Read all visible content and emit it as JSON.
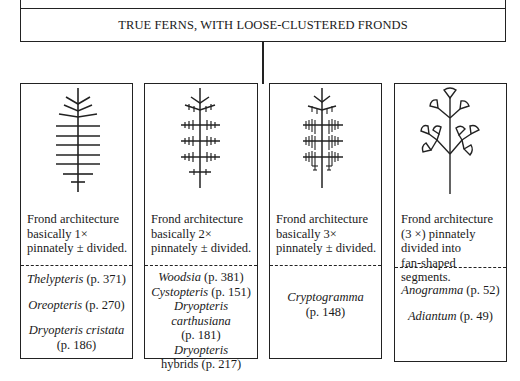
{
  "chart_header": "CHART 9",
  "title": "TRUE FERNS, WITH LOOSE-CLUSTERED FRONDS",
  "columns": [
    {
      "icon": "once-pinnate-frond-icon",
      "description": [
        "Frond architecture",
        "basically 1×",
        "pinnately ± divided."
      ],
      "genera": [
        {
          "name": "Thelypteris",
          "page": "(p. 371)"
        },
        {
          "name": "Oreopteris",
          "page": "(p. 270)"
        },
        {
          "name": "Dryopteris cristata",
          "page": "(p. 186)"
        }
      ]
    },
    {
      "icon": "twice-pinnate-frond-icon",
      "description": [
        "Frond architecture",
        "basically 2×",
        "pinnately ± divided."
      ],
      "genera": [
        {
          "name": "Woodsia",
          "page": "(p. 381)"
        },
        {
          "name": "Cystopteris",
          "page": "(p. 151)"
        },
        {
          "name": "Dryopteris carthusiana",
          "page": "(p. 181)"
        },
        {
          "name": "Dryopteris",
          "suffix": "hybrids",
          "page": "(p. 217)"
        }
      ]
    },
    {
      "icon": "thrice-pinnate-frond-icon",
      "description": [
        "Frond architecture",
        "basically 3×",
        "pinnately ± divided."
      ],
      "genera": [
        {
          "name": "Cryptogramma",
          "page": "(p. 148)"
        }
      ]
    },
    {
      "icon": "fan-segment-frond-icon",
      "description": [
        "Frond architecture",
        "(3 ×) pinnately",
        "divided into",
        "fan-shaped segments."
      ],
      "genera": [
        {
          "name": "Anogramma",
          "page": "(p. 52)"
        },
        {
          "name": "Adiantum",
          "page": "(p. 49)"
        }
      ]
    }
  ],
  "colors": {
    "line": "#222222",
    "background": "#ffffff",
    "text": "#1a1a1a"
  }
}
